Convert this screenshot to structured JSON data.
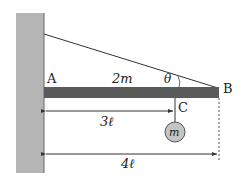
{
  "diagram": {
    "points": {
      "A": "A",
      "B": "B",
      "C": "C"
    },
    "bar_mass_label": "2m",
    "angle_label": "θ",
    "hanging_mass_label": "m",
    "dimension_AC": "3ℓ",
    "dimension_AB": "4ℓ",
    "colors": {
      "wall": "#b5b5b5",
      "bar": "#5a5a5a",
      "ball": "#c4c4c4",
      "line": "#333333"
    }
  }
}
